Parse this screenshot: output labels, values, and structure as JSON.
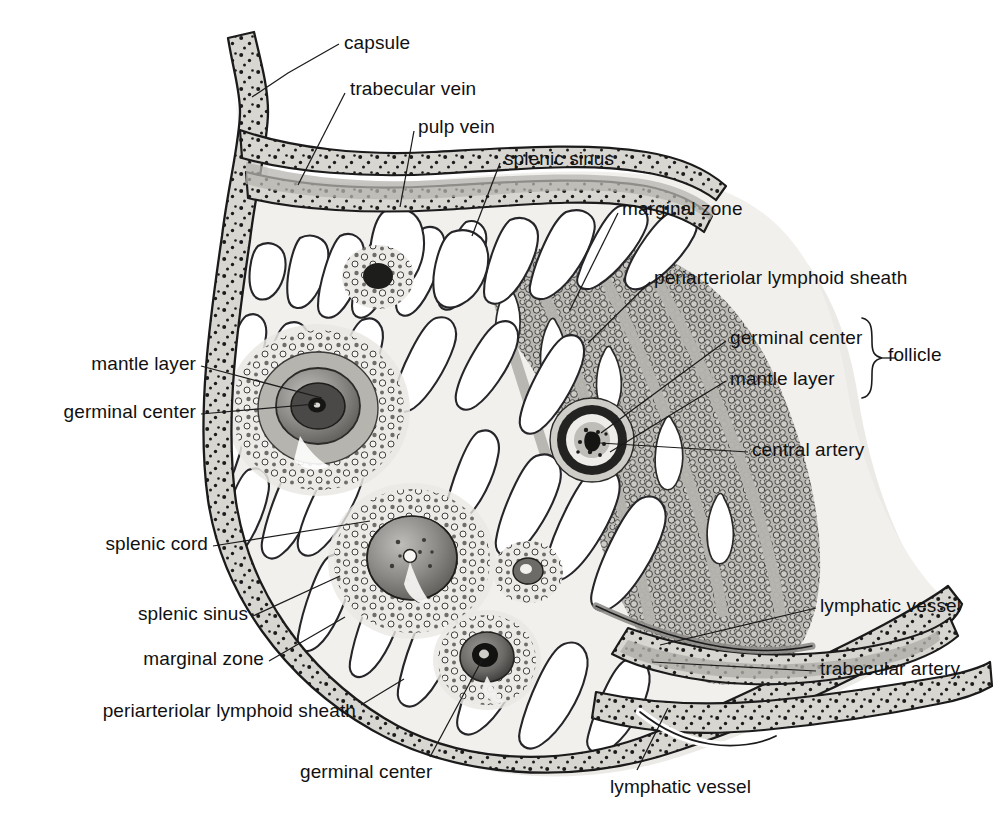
{
  "figure": {
    "colors": {
      "ink": "#111111",
      "capsule_fill": "#d8d6d1",
      "capsule_speckle": "#1a1a1a",
      "red_pulp_fill": "#f0efec",
      "white_pulp_fill": "#b9b7b2",
      "marginal_zone_fill": "#c9c7c2",
      "sinus_fill": "#ffffff",
      "lymphocyte_fill": "#cbc9c4",
      "germinal_center_fill": "#8d8b87",
      "mantle_layer_fill": "#6f6d6a",
      "central_artery_dark": "#2b2a29",
      "halo": "#e6e4e0"
    },
    "labels": [
      {
        "id": "capsule",
        "text": "capsule",
        "x": 344,
        "y": 32,
        "anchor": "left",
        "leader": [
          [
            339,
            44
          ],
          [
            288,
            73
          ],
          [
            252,
            97
          ]
        ]
      },
      {
        "id": "trabecular-vein",
        "text": "trabecular vein",
        "x": 350,
        "y": 78,
        "anchor": "left",
        "leader": [
          [
            345,
            93
          ],
          [
            298,
            185
          ]
        ]
      },
      {
        "id": "pulp-vein",
        "text": "pulp vein",
        "x": 418,
        "y": 116,
        "anchor": "left",
        "leader": [
          [
            414,
            131
          ],
          [
            400,
            207
          ]
        ]
      },
      {
        "id": "splenic-sinus-top",
        "text": "splenic sinus",
        "x": 504,
        "y": 148,
        "anchor": "left",
        "leader": [
          [
            500,
            163
          ],
          [
            472,
            236
          ]
        ]
      },
      {
        "id": "marginal-zone-top",
        "text": "marginal zone",
        "x": 622,
        "y": 198,
        "anchor": "left",
        "leader": [
          [
            618,
            213
          ],
          [
            570,
            310
          ]
        ]
      },
      {
        "id": "periarteriolar-lymphoid-sheath-top",
        "text": "periarteriolar lymphoid sheath",
        "x": 654,
        "y": 267,
        "anchor": "left",
        "leader": [
          [
            650,
            282
          ],
          [
            588,
            343
          ]
        ]
      },
      {
        "id": "germinal-center-right",
        "text": "germinal center",
        "x": 730,
        "y": 327,
        "anchor": "left",
        "leader": [
          [
            726,
            341
          ],
          [
            601,
            433
          ]
        ]
      },
      {
        "id": "mantle-layer-right",
        "text": "mantle layer",
        "x": 730,
        "y": 368,
        "anchor": "left",
        "leader": [
          [
            726,
            381
          ],
          [
            610,
            452
          ]
        ]
      },
      {
        "id": "follicle",
        "text": "follicle",
        "x": 888,
        "y": 344,
        "anchor": "left",
        "leader": []
      },
      {
        "id": "central-artery",
        "text": "central artery",
        "x": 752,
        "y": 439,
        "anchor": "left",
        "leader": [
          [
            748,
            452
          ],
          [
            600,
            443
          ]
        ]
      },
      {
        "id": "lymphatic-vessel-right",
        "text": "lymphatic vessel",
        "x": 820,
        "y": 595,
        "anchor": "left",
        "leader": [
          [
            816,
            608
          ],
          [
            660,
            645
          ]
        ]
      },
      {
        "id": "trabecular-artery",
        "text": "trabecular artery",
        "x": 820,
        "y": 658,
        "anchor": "left",
        "leader": [
          [
            816,
            671
          ],
          [
            652,
            662
          ]
        ]
      },
      {
        "id": "mantle-layer-left",
        "text": "mantle layer",
        "x": 196,
        "y": 353,
        "anchor": "right",
        "leader": [
          [
            201,
            366
          ],
          [
            322,
            398
          ]
        ]
      },
      {
        "id": "germinal-center-left",
        "text": "germinal center",
        "x": 196,
        "y": 401,
        "anchor": "right",
        "leader": [
          [
            201,
            414
          ],
          [
            316,
            404
          ]
        ]
      },
      {
        "id": "splenic-cord",
        "text": "splenic cord",
        "x": 208,
        "y": 533,
        "anchor": "right",
        "leader": [
          [
            213,
            546
          ],
          [
            370,
            521
          ]
        ]
      },
      {
        "id": "splenic-sinus-left",
        "text": "splenic sinus",
        "x": 248,
        "y": 603,
        "anchor": "right",
        "leader": [
          [
            253,
            616
          ],
          [
            340,
            576
          ]
        ]
      },
      {
        "id": "marginal-zone-left",
        "text": "marginal zone",
        "x": 264,
        "y": 648,
        "anchor": "right",
        "leader": [
          [
            269,
            661
          ],
          [
            345,
            617
          ]
        ]
      },
      {
        "id": "periarteriolar-lymphoid-sheath-left",
        "text": "periarteriolar lymphoid sheath",
        "x": 356,
        "y": 700,
        "anchor": "right",
        "leader": [
          [
            361,
            705
          ],
          [
            404,
            679
          ]
        ]
      },
      {
        "id": "germinal-center-bottom",
        "text": "germinal center",
        "x": 300,
        "y": 761,
        "anchor": "left",
        "leader": [
          [
            430,
            757
          ],
          [
            482,
            660
          ]
        ]
      },
      {
        "id": "lymphatic-vessel-bottom",
        "text": "lymphatic vessel",
        "x": 610,
        "y": 776,
        "anchor": "left",
        "leader": [
          [
            637,
            770
          ],
          [
            668,
            708
          ]
        ]
      }
    ]
  }
}
